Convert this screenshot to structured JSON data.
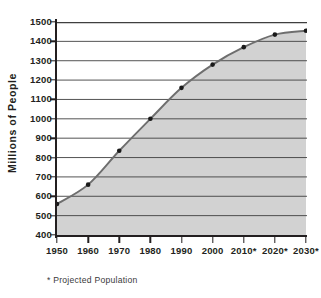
{
  "chart_data": {
    "type": "area",
    "title": "",
    "subtitle": "",
    "xlabel": "",
    "ylabel": "Millions of People",
    "categories": [
      "1950",
      "1960",
      "1970",
      "1980",
      "1990",
      "2000",
      "2010*",
      "2020*",
      "2030*"
    ],
    "x": [
      1950,
      1960,
      1970,
      1980,
      1990,
      2000,
      2010,
      2020,
      2030
    ],
    "values": [
      560,
      660,
      835,
      1000,
      1160,
      1280,
      1370,
      1435,
      1455
    ],
    "series": [
      {
        "name": "Population",
        "values": [
          560,
          660,
          835,
          1000,
          1160,
          1280,
          1370,
          1435,
          1455
        ]
      }
    ],
    "ylim": [
      400,
      1500
    ],
    "yticks": [
      400,
      500,
      600,
      700,
      800,
      900,
      1000,
      1100,
      1200,
      1300,
      1400,
      1500
    ],
    "ytick_labels": [
      "400",
      "500",
      "600",
      "700",
      "800",
      "900",
      "1000",
      "1100",
      "1200",
      "1300",
      "1400",
      "1500"
    ],
    "grid": true,
    "grid_axis": "y",
    "legend": false,
    "legend_position": "none",
    "annotations": [
      "* Projected Population"
    ],
    "marker": "filled-circle",
    "fill_color": "#d2d2d2",
    "line_color": "#6e6e6e",
    "marker_color": "#1a1a1a",
    "axis_color": "#231f20",
    "grid_color": "#3f3f3f",
    "background_color": "#ffffff"
  },
  "footnote": {
    "text": "* Projected Population"
  }
}
